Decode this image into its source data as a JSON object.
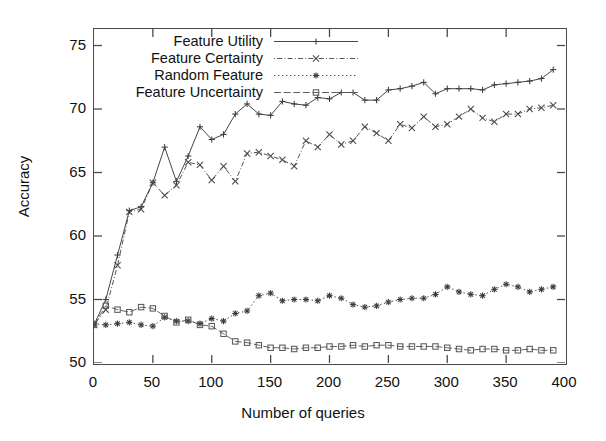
{
  "chart_data": {
    "type": "line",
    "title": "",
    "xlabel": "Number of queries",
    "ylabel": "Accuracy",
    "xlim": [
      0,
      400
    ],
    "ylim": [
      50,
      76.3
    ],
    "xticks": [
      0,
      50,
      100,
      150,
      200,
      250,
      300,
      350,
      400
    ],
    "yticks": [
      50,
      55,
      60,
      65,
      70,
      75
    ],
    "grid": false,
    "legend_position": "top-left",
    "x": [
      0,
      10,
      20,
      30,
      40,
      50,
      60,
      70,
      80,
      90,
      100,
      110,
      120,
      130,
      140,
      150,
      160,
      170,
      180,
      190,
      200,
      210,
      220,
      230,
      240,
      250,
      260,
      270,
      280,
      290,
      300,
      310,
      320,
      330,
      340,
      350,
      360,
      370,
      380,
      390
    ],
    "series": [
      {
        "name": "Feature Utility",
        "marker": "plus",
        "dash": "solid",
        "color": "#3c3c3c",
        "values": [
          53.0,
          55.0,
          58.5,
          62.0,
          62.3,
          64.2,
          67.0,
          64.3,
          66.3,
          68.6,
          67.6,
          68.0,
          69.6,
          70.4,
          69.6,
          69.5,
          70.6,
          70.4,
          70.3,
          70.9,
          70.8,
          71.3,
          71.3,
          70.7,
          70.7,
          71.5,
          71.6,
          71.8,
          72.1,
          71.2,
          71.6,
          71.6,
          71.6,
          71.5,
          71.9,
          72.0,
          72.1,
          72.2,
          72.4,
          73.1
        ]
      },
      {
        "name": "Feature Certainty",
        "marker": "x",
        "dash": "dot-dash",
        "color": "#4a4a4a",
        "values": [
          53.0,
          54.2,
          57.7,
          61.9,
          62.1,
          64.2,
          63.2,
          64.0,
          65.8,
          65.6,
          64.4,
          65.5,
          64.3,
          66.5,
          66.6,
          66.3,
          66.0,
          65.5,
          67.5,
          67.0,
          68.0,
          67.2,
          67.5,
          68.6,
          68.1,
          67.5,
          68.8,
          68.5,
          69.4,
          68.6,
          68.8,
          69.4,
          70.0,
          69.3,
          69.0,
          69.6,
          69.6,
          70.0,
          70.1,
          70.3
        ]
      },
      {
        "name": "Random Feature",
        "marker": "star",
        "dash": "dotted",
        "color": "#3a3a3a",
        "values": [
          53.1,
          53.0,
          53.1,
          53.2,
          53.0,
          52.9,
          53.6,
          53.3,
          53.3,
          53.1,
          53.5,
          53.3,
          53.9,
          54.1,
          55.3,
          55.5,
          54.9,
          55.0,
          55.0,
          54.9,
          55.3,
          55.1,
          54.6,
          54.4,
          54.5,
          54.8,
          55.0,
          55.1,
          55.1,
          55.4,
          56.0,
          55.6,
          55.4,
          55.3,
          55.8,
          56.2,
          56.0,
          55.6,
          55.8,
          56.0
        ]
      },
      {
        "name": "Feature Uncertainty",
        "marker": "square",
        "dash": "solid-light",
        "color": "#5a5a5a",
        "values": [
          53.0,
          54.5,
          54.2,
          54.0,
          54.4,
          54.3,
          53.7,
          53.2,
          53.4,
          53.0,
          52.9,
          52.3,
          51.7,
          51.6,
          51.4,
          51.2,
          51.2,
          51.1,
          51.2,
          51.2,
          51.3,
          51.3,
          51.4,
          51.3,
          51.4,
          51.4,
          51.3,
          51.3,
          51.3,
          51.3,
          51.2,
          51.1,
          51.0,
          51.1,
          51.1,
          51.0,
          51.0,
          51.1,
          51.0,
          51.0
        ]
      }
    ]
  },
  "legend": {
    "items": [
      {
        "label": "Feature Utility"
      },
      {
        "label": "Feature Certainty"
      },
      {
        "label": "Random Feature"
      },
      {
        "label": "Feature Uncertainty"
      }
    ]
  },
  "axes": {
    "y_title": "Accuracy",
    "x_title": "Number of queries",
    "y_tick_labels": [
      "50",
      "55",
      "60",
      "65",
      "70",
      "75"
    ],
    "x_tick_labels": [
      "0",
      "50",
      "100",
      "150",
      "200",
      "250",
      "300",
      "350",
      "400"
    ]
  }
}
